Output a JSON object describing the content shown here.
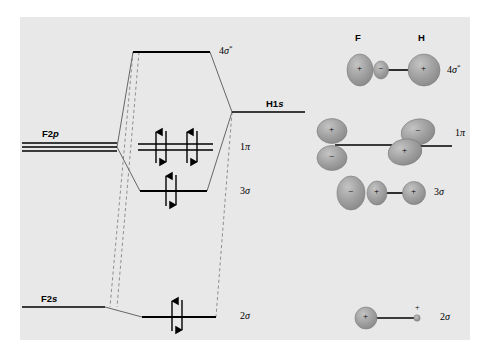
{
  "figure": {
    "background_color": "#ffffff",
    "panel_color": "#e8e8e8",
    "line_color": "#000000",
    "orbital_fill": "#9a9a9a",
    "orbital_stroke": "#6e6e6e"
  },
  "atomic_levels": {
    "f2p": {
      "label": "F2p",
      "label_text": "F2",
      "label_italic": "p",
      "degeneracy": 3,
      "energy_y": 147
    },
    "f2s": {
      "label": "F2s",
      "label_text": "F2",
      "label_italic": "s",
      "degeneracy": 1,
      "energy_y": 307
    },
    "h1s": {
      "label": "H1s",
      "label_text": "H1",
      "label_italic": "s",
      "degeneracy": 1,
      "energy_y": 112
    }
  },
  "molecular_orbitals": [
    {
      "name": "4sigma-star",
      "label_base": "4",
      "label_greek": "σ",
      "label_star": "*",
      "energy_y": 52,
      "electrons": 0,
      "degeneracy": 1,
      "type": "antibonding"
    },
    {
      "name": "1pi",
      "label_base": "1",
      "label_greek": "π",
      "label_star": "",
      "energy_y": 147,
      "electrons": 4,
      "degeneracy": 2,
      "type": "nonbonding"
    },
    {
      "name": "3sigma",
      "label_base": "3",
      "label_greek": "σ",
      "label_star": "",
      "energy_y": 191,
      "electrons": 2,
      "degeneracy": 1,
      "type": "bonding"
    },
    {
      "name": "2sigma",
      "label_base": "2",
      "label_greek": "σ",
      "label_star": "",
      "energy_y": 317,
      "electrons": 2,
      "degeneracy": 1,
      "type": "bonding"
    }
  ],
  "orbital_pictures": {
    "column_headers": [
      {
        "name": "header-f",
        "label": "F"
      },
      {
        "name": "header-h",
        "label": "H"
      }
    ],
    "rows": [
      {
        "name": "picture-4sigma-star",
        "label_base": "4",
        "label_greek": "σ",
        "label_star": "*",
        "signs": [
          "+",
          "−",
          "+"
        ]
      },
      {
        "name": "picture-1pi",
        "label_base": "1",
        "label_greek": "π",
        "label_star": "",
        "signs": [
          "+",
          "−",
          "−",
          "+"
        ]
      },
      {
        "name": "picture-3sigma",
        "label_base": "3",
        "label_greek": "σ",
        "label_star": "",
        "signs": [
          "−",
          "+",
          "+"
        ]
      },
      {
        "name": "picture-2sigma",
        "label_base": "2",
        "label_greek": "σ",
        "label_star": "",
        "signs": [
          "+",
          "+"
        ]
      }
    ]
  }
}
